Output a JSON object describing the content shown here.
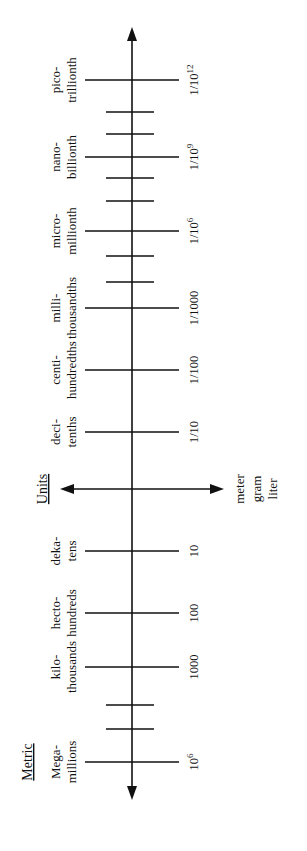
{
  "diagram": {
    "title_sections": {
      "metric": "Metric",
      "units": "Units"
    },
    "axis": {
      "x": 132,
      "top_y": 27,
      "bottom_y": 800,
      "direction_up": "smaller (fractions)",
      "direction_down": "larger (multiples)"
    },
    "base_units": {
      "arrow_y": 489,
      "arrow_left_x": 60,
      "arrow_right_x": 224,
      "labels": [
        "meter",
        "gram",
        "liter"
      ]
    },
    "prefixes": [
      {
        "y": 80,
        "prefix": "pico-",
        "meaning": "trillionth",
        "value_main": "1/10",
        "value_sup": "12"
      },
      {
        "y": 157,
        "prefix": "nano-",
        "meaning": "billionth",
        "value_main": "1/10",
        "value_sup": "9"
      },
      {
        "y": 231,
        "prefix": "micro-",
        "meaning": "millionth",
        "value_main": "1/10",
        "value_sup": "6"
      },
      {
        "y": 308,
        "prefix": "milli-",
        "meaning": "thousandths",
        "value_main": "1/1000",
        "value_sup": ""
      },
      {
        "y": 370,
        "prefix": "centi-",
        "meaning": "hundredths",
        "value_main": "1/100",
        "value_sup": ""
      },
      {
        "y": 432,
        "prefix": "deci-",
        "meaning": "tenths",
        "value_main": "1/10",
        "value_sup": ""
      },
      {
        "y": 551,
        "prefix": "deka-",
        "meaning": "tens",
        "value_main": "10",
        "value_sup": ""
      },
      {
        "y": 613,
        "prefix": "hecto-",
        "meaning": "hundreds",
        "value_main": "100",
        "value_sup": ""
      },
      {
        "y": 667,
        "prefix": "kilo-",
        "meaning": "thousands",
        "value_main": "1000",
        "value_sup": ""
      },
      {
        "y": 762,
        "prefix": "Mega-",
        "meaning": "millions",
        "value_main": "10",
        "value_sup": "6"
      }
    ],
    "minor_ticks": [
      112,
      134,
      178,
      201,
      256,
      282,
      705,
      729
    ],
    "section_label_positions": {
      "units_y": 489,
      "metric_y": 762
    }
  }
}
